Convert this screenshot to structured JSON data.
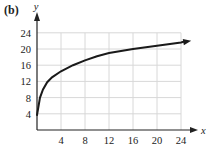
{
  "panel_label": "(b)",
  "chart_data": {
    "type": "line",
    "title": "",
    "xlabel": "x",
    "ylabel": "y",
    "xlim": [
      0,
      24
    ],
    "ylim": [
      0,
      24
    ],
    "x_ticks": [
      4,
      8,
      12,
      16,
      20,
      24
    ],
    "y_ticks": [
      4,
      8,
      12,
      16,
      20,
      24
    ],
    "grid": true,
    "legend": null,
    "series": [
      {
        "name": "curve",
        "x": [
          0,
          0.5,
          1,
          1.7,
          2.5,
          4,
          6,
          8,
          10,
          12,
          16,
          20,
          24,
          24.7
        ],
        "y": [
          3.7,
          8,
          10,
          11.8,
          13,
          14.5,
          16,
          17.2,
          18.2,
          19,
          20,
          20.8,
          21.6,
          21.9
        ],
        "end_arrow": true
      }
    ]
  }
}
